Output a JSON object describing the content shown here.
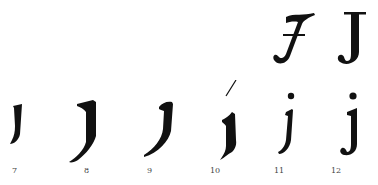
{
  "figure": {
    "ink_color": "#111111",
    "background": "#ffffff",
    "upper_row": [
      {
        "id": "J-script",
        "form": "italic capital J with crossbar"
      },
      {
        "id": "J-roman",
        "form": "roman capital J"
      }
    ],
    "lower_row": [
      {
        "label": "7",
        "form": "blackletter i-stroke with tail"
      },
      {
        "label": "8",
        "form": "blackletter long j with flag and long descending tail"
      },
      {
        "label": "9",
        "form": "blackletter j with curved descender"
      },
      {
        "label": "10",
        "form": "blackletter j with diacritic stroke above"
      },
      {
        "label": "11",
        "form": "italic lowercase j with dot"
      },
      {
        "label": "12",
        "form": "roman lowercase j with dot"
      }
    ]
  }
}
